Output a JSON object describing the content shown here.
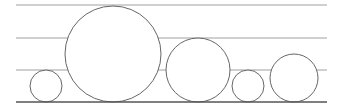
{
  "diagram": {
    "width": 345,
    "height": 106,
    "line_color": "#a0a0a0",
    "baseline_color": "#555555",
    "circle_stroke": "#666666",
    "guides": [
      {
        "y": 5,
        "x1": 16,
        "x2": 327
      },
      {
        "y": 38,
        "x1": 16,
        "x2": 327
      },
      {
        "y": 70,
        "x1": 16,
        "x2": 327
      }
    ],
    "baseline": {
      "y": 102,
      "x1": 16,
      "x2": 327
    },
    "circles": [
      {
        "cx": 46,
        "cy": 86,
        "r": 16
      },
      {
        "cx": 113,
        "cy": 54,
        "r": 48
      },
      {
        "cx": 198,
        "cy": 70,
        "r": 32
      },
      {
        "cx": 248,
        "cy": 86,
        "r": 16
      },
      {
        "cx": 294,
        "cy": 78,
        "r": 24
      }
    ]
  }
}
